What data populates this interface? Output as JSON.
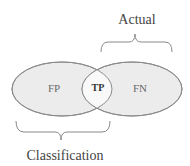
{
  "diagram": {
    "type": "venn",
    "sets": [
      {
        "name": "Classification",
        "region_label": "FP"
      },
      {
        "name": "Actual",
        "region_label": "FN"
      }
    ],
    "intersection_label": "TP",
    "labels": {
      "top": "Actual",
      "bottom": "Classification",
      "fp": "FP",
      "tp": "TP",
      "fn": "FN"
    },
    "colors": {
      "fill": "#ececec",
      "intersection_fill": "#f8f8f8",
      "stroke": "#8a8a8a",
      "text": "#555555"
    }
  }
}
